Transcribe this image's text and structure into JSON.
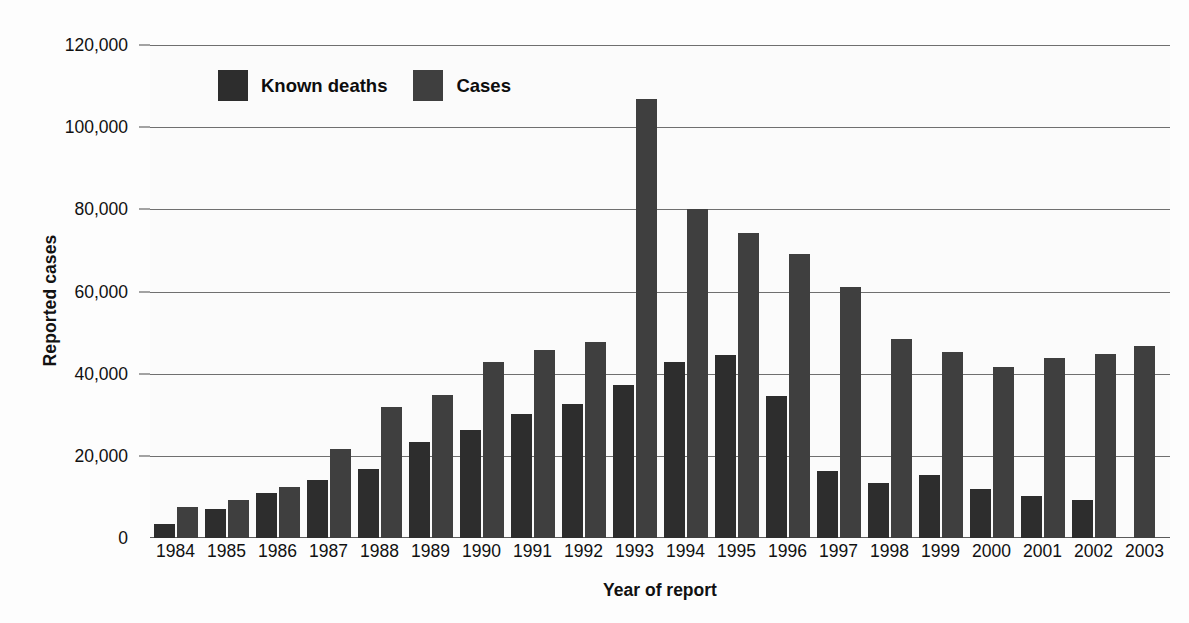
{
  "chart_data": {
    "type": "bar",
    "title": "",
    "xlabel": "Year of report",
    "ylabel": "Reported cases",
    "ylim": [
      0,
      120000
    ],
    "yticks": [
      0,
      20000,
      40000,
      60000,
      80000,
      100000,
      120000
    ],
    "ytick_labels": [
      "0",
      "20,000",
      "40,000",
      "60,000",
      "80,000",
      "100,000",
      "120,000"
    ],
    "grid": true,
    "legend_position": "top-left-inside",
    "categories": [
      "1984",
      "1985",
      "1986",
      "1987",
      "1988",
      "1989",
      "1990",
      "1991",
      "1992",
      "1993",
      "1994",
      "1995",
      "1996",
      "1997",
      "1998",
      "1999",
      "2000",
      "2001",
      "2002",
      "2003"
    ],
    "series": [
      {
        "name": "Known deaths",
        "color": "#2d2d2d",
        "values": [
          3500,
          7000,
          11000,
          14200,
          16700,
          23300,
          26200,
          30200,
          32700,
          37300,
          42800,
          44500,
          34600,
          16300,
          13400,
          15400,
          12000,
          10300,
          9300,
          null
        ]
      },
      {
        "name": "Cases",
        "color": "#3f3f3f",
        "values": [
          7500,
          9300,
          12500,
          21600,
          31800,
          34800,
          42800,
          45700,
          47600,
          106800,
          80100,
          74200,
          69100,
          61200,
          48500,
          45300,
          41600,
          43700,
          44900,
          46700
        ]
      }
    ]
  },
  "legend": {
    "entries": [
      {
        "label": "Known deaths",
        "swatch": "deaths"
      },
      {
        "label": "Cases",
        "swatch": "cases"
      }
    ]
  }
}
